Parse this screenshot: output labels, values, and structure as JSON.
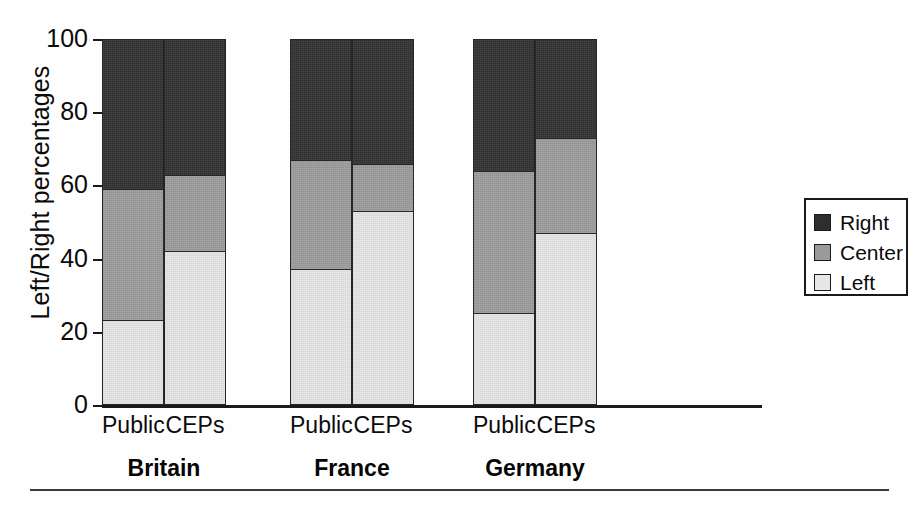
{
  "chart_data": {
    "type": "bar",
    "subtype": "stacked-100-percent",
    "title": "",
    "xlabel": "",
    "ylabel": "Left/Right percentages",
    "ylim": [
      0,
      100
    ],
    "yticks": [
      0,
      20,
      40,
      60,
      80,
      100
    ],
    "grid": false,
    "legend_position": "right",
    "groups": [
      "Britain",
      "France",
      "Germany"
    ],
    "subcategories": [
      "Public",
      "CEPs"
    ],
    "categories": [
      "Britain Public",
      "Britain CEPs",
      "France Public",
      "France CEPs",
      "Germany Public",
      "Germany CEPs"
    ],
    "series": [
      {
        "name": "Left",
        "color": "#e7e7e7",
        "values": [
          23,
          42,
          37,
          53,
          25,
          47
        ]
      },
      {
        "name": "Center",
        "color": "#9a9a9a",
        "values": [
          36,
          21,
          30,
          13,
          39,
          26
        ]
      },
      {
        "name": "Right",
        "color": "#2e2e2e",
        "values": [
          41,
          37,
          33,
          34,
          36,
          27
        ]
      }
    ],
    "cumulative_tops": {
      "left": [
        23,
        42,
        37,
        53,
        25,
        47
      ],
      "center": [
        59,
        63,
        67,
        66,
        64,
        73
      ],
      "right": [
        100,
        100,
        100,
        100,
        100,
        100
      ]
    }
  },
  "axis": {
    "y_title": "Left/Right percentages",
    "ticks": [
      {
        "label": "100",
        "value": 100
      },
      {
        "label": "80",
        "value": 80
      },
      {
        "label": "60",
        "value": 60
      },
      {
        "label": "40",
        "value": 40
      },
      {
        "label": "20",
        "value": 20
      },
      {
        "label": "0",
        "value": 0
      }
    ]
  },
  "bars": [
    {
      "name": "britain-public",
      "sub_label": "Public",
      "left": 23,
      "center": 36,
      "right": 41,
      "left_top": 23,
      "center_top": 59
    },
    {
      "name": "britain-ceps",
      "sub_label": "CEPs",
      "left": 42,
      "center": 21,
      "right": 37,
      "left_top": 42,
      "center_top": 63
    },
    {
      "name": "france-public",
      "sub_label": "Public",
      "left": 37,
      "center": 30,
      "right": 33,
      "left_top": 37,
      "center_top": 67
    },
    {
      "name": "france-ceps",
      "sub_label": "CEPs",
      "left": 53,
      "center": 13,
      "right": 34,
      "left_top": 53,
      "center_top": 66
    },
    {
      "name": "germany-public",
      "sub_label": "Public",
      "left": 25,
      "center": 39,
      "right": 36,
      "left_top": 25,
      "center_top": 64
    },
    {
      "name": "germany-ceps",
      "sub_label": "CEPs",
      "left": 47,
      "center": 26,
      "right": 27,
      "left_top": 47,
      "center_top": 73
    }
  ],
  "group_labels": [
    {
      "name": "britain",
      "label": "Britain"
    },
    {
      "name": "france",
      "label": "France"
    },
    {
      "name": "germany",
      "label": "Germany"
    }
  ],
  "legend": {
    "items": [
      {
        "name": "right",
        "label": "Right",
        "color": "#2e2e2e"
      },
      {
        "name": "center",
        "label": "Center",
        "color": "#9a9a9a"
      },
      {
        "name": "left",
        "label": "Left",
        "color": "#e7e7e7"
      }
    ]
  }
}
